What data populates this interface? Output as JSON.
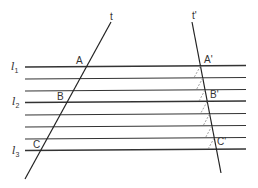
{
  "diagram": {
    "type": "geometry",
    "colors": {
      "line": "#333333",
      "guide": "#888888",
      "background": "#ffffff"
    },
    "parallel_lines_y": [
      67,
      79,
      91,
      102,
      115,
      127,
      139,
      150
    ],
    "parallel_line_labels": [
      {
        "name": "l",
        "sub": "1",
        "y": 67
      },
      {
        "name": "l",
        "sub": "2",
        "y": 102
      },
      {
        "name": "l",
        "sub": "3",
        "y": 150
      }
    ],
    "transversals": [
      {
        "label": "t",
        "from": [
          111,
          22
        ],
        "to": [
          25,
          179
        ]
      },
      {
        "label": "t'",
        "from": [
          192,
          22
        ],
        "to": [
          221,
          173
        ]
      }
    ],
    "points": [
      {
        "label": "A",
        "on": "t",
        "line": "l1"
      },
      {
        "label": "B",
        "on": "t",
        "line": "l2"
      },
      {
        "label": "C",
        "on": "t",
        "line": "l3"
      },
      {
        "label": "A'",
        "on": "t'",
        "line": "l1"
      },
      {
        "label": "B'",
        "on": "t'",
        "line": "l2"
      },
      {
        "label": "C'",
        "on": "t'",
        "line": "l3"
      }
    ],
    "labels": {
      "t": "t",
      "t_prime": "t'",
      "A": "A",
      "B": "B",
      "C": "C",
      "A_prime": "A'",
      "B_prime": "B'",
      "C_prime": "C'",
      "l": "l",
      "sub1": "1",
      "sub2": "2",
      "sub3": "3"
    }
  }
}
